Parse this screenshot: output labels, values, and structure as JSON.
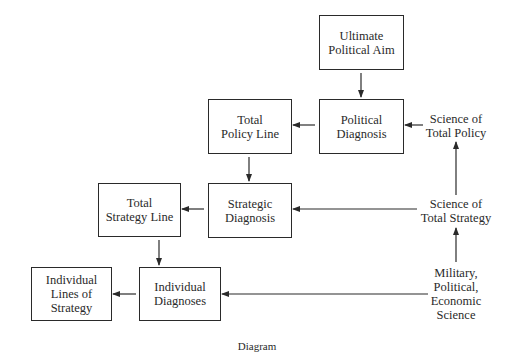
{
  "diagram": {
    "nodes": {
      "ultimate_political_aim": {
        "line1": "Ultimate",
        "line2": "Political Aim"
      },
      "political_diagnosis": {
        "line1": "Political",
        "line2": "Diagnosis"
      },
      "total_policy_line": {
        "line1": "Total",
        "line2": "Policy Line"
      },
      "strategic_diagnosis": {
        "line1": "Strategic",
        "line2": "Diagnosis"
      },
      "total_strategy_line": {
        "line1": "Total",
        "line2": "Strategy Line"
      },
      "individual_diagnoses": {
        "line1": "Individual",
        "line2": "Diagnoses"
      },
      "individual_lines_of_strategy": {
        "line1": "Individual",
        "line2": "Lines of",
        "line3": "Strategy"
      }
    },
    "sources": {
      "science_total_policy": {
        "line1": "Science of",
        "line2": "Total Policy"
      },
      "science_total_strategy": {
        "line1": "Science of",
        "line2": "Total Strategy"
      },
      "military_political_economic": {
        "line1": "Military,",
        "line2": "Political,",
        "line3": "Economic",
        "line4": "Science"
      }
    },
    "edges": [
      {
        "from": "Ultimate Political Aim",
        "to": "Political Diagnosis"
      },
      {
        "from": "Science of Total Policy",
        "to": "Political Diagnosis"
      },
      {
        "from": "Political Diagnosis",
        "to": "Total Policy Line"
      },
      {
        "from": "Total Policy Line",
        "to": "Strategic Diagnosis"
      },
      {
        "from": "Science of Total Strategy",
        "to": "Strategic Diagnosis"
      },
      {
        "from": "Science of Total Strategy",
        "to": "Science of Total Policy"
      },
      {
        "from": "Strategic Diagnosis",
        "to": "Total Strategy Line"
      },
      {
        "from": "Total Strategy Line",
        "to": "Individual Diagnoses"
      },
      {
        "from": "Military, Political, Economic Science",
        "to": "Science of Total Strategy"
      },
      {
        "from": "Military, Political, Economic Science",
        "to": "Individual Diagnoses"
      },
      {
        "from": "Individual Diagnoses",
        "to": "Individual Lines of Strategy"
      }
    ],
    "caption": "Diagram"
  }
}
